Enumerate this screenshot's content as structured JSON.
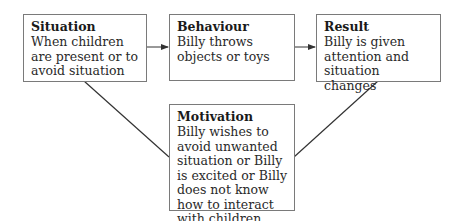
{
  "diagram": {
    "nodes": [
      {
        "id": "situation",
        "title": "Situation",
        "text": "When children are present or to avoid situation"
      },
      {
        "id": "behaviour",
        "title": "Behaviour",
        "text": "Billy throws objects or toys"
      },
      {
        "id": "result",
        "title": "Result",
        "text": "Billy is given attention and situation changes"
      },
      {
        "id": "motivation",
        "title": "Motivation",
        "text": "Billy wishes to avoid unwanted situation or Billy is excited or Billy does not know how to interact with children"
      }
    ],
    "edges": [
      {
        "from": "situation",
        "to": "behaviour",
        "type": "arrow"
      },
      {
        "from": "behaviour",
        "to": "result",
        "type": "arrow"
      },
      {
        "from": "situation",
        "to": "motivation",
        "type": "line"
      },
      {
        "from": "result",
        "to": "motivation",
        "type": "line"
      }
    ],
    "colors": {
      "border": "#7a7a7a",
      "line": "#333333",
      "text": "#222222"
    }
  }
}
